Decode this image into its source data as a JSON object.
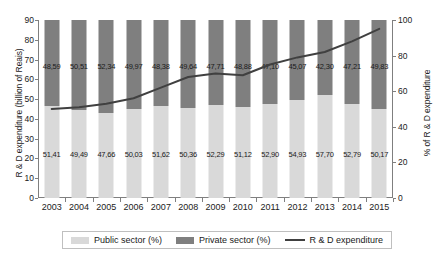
{
  "chart_data": {
    "type": "bar",
    "title": "",
    "subtitle": "",
    "xlabel": "",
    "ylabel": "R & D expenditure (billion of Reais)",
    "ylabel_right": "% of R & D expenditure",
    "ylim": [
      0,
      90
    ],
    "ylim_right": [
      0,
      100
    ],
    "yticks": [
      0,
      10,
      20,
      30,
      40,
      50,
      60,
      70,
      80,
      90
    ],
    "yticks_right": [
      0,
      20,
      40,
      60,
      80,
      100
    ],
    "grid": false,
    "legend_position": "bottom",
    "stacked": true,
    "categories": [
      "2003",
      "2004",
      "2005",
      "2006",
      "2007",
      "2008",
      "2009",
      "2010",
      "2011",
      "2012",
      "2013",
      "2014",
      "2015"
    ],
    "series": [
      {
        "name": "Public sector (%)",
        "type": "bar",
        "color": "#d9d9d9",
        "axis": "left",
        "values": [
          51.41,
          49.49,
          47.66,
          50.03,
          51.62,
          50.36,
          52.29,
          51.12,
          52.9,
          54.93,
          57.7,
          52.79,
          50.17
        ],
        "labels": [
          "51,41",
          "49,49",
          "47,66",
          "50,03",
          "51,62",
          "50,36",
          "52,29",
          "51,12",
          "52,90",
          "54,93",
          "57,70",
          "52,79",
          "50,17"
        ]
      },
      {
        "name": "Private sector (%)",
        "type": "bar",
        "color": "#7f7f7f",
        "axis": "left",
        "values": [
          48.59,
          50.51,
          52.34,
          49.97,
          48.38,
          49.64,
          47.71,
          48.88,
          47.1,
          45.07,
          42.3,
          47.21,
          49.83
        ],
        "labels": [
          "48,59",
          "50,51",
          "52,34",
          "49,97",
          "48,38",
          "49,64",
          "47,71",
          "48,88",
          "47,10",
          "45,07",
          "42,30",
          "47,21",
          "49,83"
        ]
      },
      {
        "name": "R & D expenditure",
        "type": "line",
        "color": "#404040",
        "axis": "right",
        "values": [
          50,
          51,
          53,
          56,
          62,
          68,
          70,
          69,
          75,
          79,
          82,
          88,
          95
        ]
      }
    ]
  },
  "legend": {
    "public_label": "Public sector (%)",
    "private_label": "Private sector (%)",
    "line_label": "R & D expenditure"
  },
  "axes": {
    "left_title": "R & D expenditure (billion of Reais)",
    "right_title": "% of R & D expenditure"
  }
}
